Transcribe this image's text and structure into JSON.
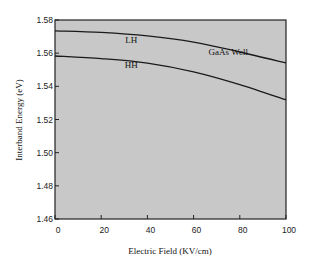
{
  "chart_data": {
    "type": "line",
    "title": "",
    "xlabel": "Electric Field (KV/cm)",
    "ylabel": "Interband Energy (eV)",
    "xlim": [
      0,
      100
    ],
    "ylim": [
      1.46,
      1.58
    ],
    "xticks": [
      0,
      20,
      40,
      60,
      80,
      100
    ],
    "yticks": [
      1.46,
      1.48,
      1.5,
      1.52,
      1.54,
      1.56,
      1.58
    ],
    "xtick_labels": [
      "0",
      "20",
      "40",
      "60",
      "80",
      "100"
    ],
    "ytick_labels": [
      "1.46",
      "1.48",
      "1.50",
      "1.52",
      "1.54",
      "1.56",
      "1.58"
    ],
    "grid": false,
    "background": "#c8c8c8",
    "x": [
      0,
      20,
      40,
      60,
      80,
      100
    ],
    "series": [
      {
        "name": "LH",
        "values": [
          1.5735,
          1.5725,
          1.5704,
          1.5667,
          1.5607,
          1.5541
        ]
      },
      {
        "name": "HH",
        "values": [
          1.5583,
          1.5567,
          1.554,
          1.5487,
          1.541,
          1.5318
        ]
      }
    ],
    "annotations": [
      {
        "text": "LH",
        "x": 33,
        "y": 1.566
      },
      {
        "text": "HH",
        "x": 33,
        "y": 1.551
      },
      {
        "text": "GaAs Well",
        "x": 75,
        "y": 1.559
      }
    ]
  }
}
